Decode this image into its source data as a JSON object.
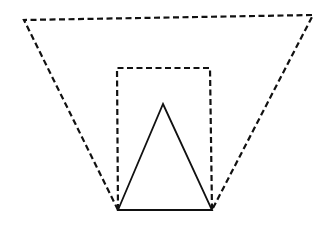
{
  "diagram": {
    "width": 331,
    "height": 233,
    "background": "#ffffff",
    "stroke_color": "#111111",
    "shapes": [
      {
        "name": "outer-trapezoid",
        "kind": "polygon",
        "style": "dashed",
        "stroke_width": 2.2,
        "dash": "6 3.5",
        "points": [
          [
            24,
            20
          ],
          [
            313,
            15
          ],
          [
            212,
            210
          ],
          [
            118,
            210
          ]
        ],
        "closed_top_bottom_sides": "top edge plus two slanted sides meeting at base vertices"
      },
      {
        "name": "inner-rectangle",
        "kind": "polyline",
        "style": "dashed",
        "stroke_width": 2.2,
        "dash": "6 3.5",
        "points": [
          [
            118,
            210
          ],
          [
            117,
            68
          ],
          [
            210,
            68
          ],
          [
            212,
            210
          ]
        ]
      },
      {
        "name": "solid-triangle",
        "kind": "polygon",
        "style": "solid",
        "stroke_width": 1.8,
        "points": [
          [
            163,
            104
          ],
          [
            212,
            210
          ],
          [
            118,
            210
          ]
        ]
      }
    ]
  }
}
